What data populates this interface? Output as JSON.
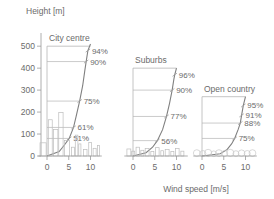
{
  "figure": {
    "y_axis_title": "Height [m]",
    "x_axis_title": "Wind speed [m/s]",
    "y_ticks": [
      "0",
      "100",
      "200",
      "300",
      "400",
      "500"
    ],
    "y_values": [
      0,
      100,
      200,
      300,
      400,
      500
    ],
    "x_ticks": [
      "0",
      "5",
      "10"
    ],
    "x_values": [
      0,
      5,
      10
    ]
  },
  "chart_data": {
    "type": "line",
    "title": "",
    "xlabel": "Wind speed [m/s]",
    "ylabel": "Height [m]",
    "xlim": [
      -2,
      13
    ],
    "ylim": [
      0,
      560
    ],
    "grid": false,
    "legend": "none",
    "panels": [
      {
        "name": "City centre",
        "title": "City centre",
        "roughness_class": "city-centre",
        "boundary_layer_height": 500,
        "profile_exponent": 0.36,
        "reference_wind_speed": 10,
        "annotations": [
          {
            "label": "94%",
            "height": 480,
            "wind_pct": 94
          },
          {
            "label": "90%",
            "height": 430,
            "wind_pct": 90
          },
          {
            "label": "75%",
            "height": 250,
            "wind_pct": 75
          },
          {
            "label": "61%",
            "height": 130,
            "wind_pct": 61
          },
          {
            "label": "51%",
            "height": 80,
            "wind_pct": 51
          }
        ],
        "profile_points": [
          {
            "h": 0,
            "u": 0.0
          },
          {
            "h": 20,
            "u": 0.28
          },
          {
            "h": 50,
            "u": 0.4
          },
          {
            "h": 80,
            "u": 0.51
          },
          {
            "h": 130,
            "u": 0.61
          },
          {
            "h": 180,
            "u": 0.67
          },
          {
            "h": 250,
            "u": 0.75
          },
          {
            "h": 320,
            "u": 0.82
          },
          {
            "h": 390,
            "u": 0.87
          },
          {
            "h": 430,
            "u": 0.9
          },
          {
            "h": 480,
            "u": 0.94
          },
          {
            "h": 510,
            "u": 1.0
          }
        ],
        "skyline": [
          {
            "x": -1.6,
            "w": 1.4,
            "h": 60
          },
          {
            "x": 0.3,
            "w": 0.9,
            "h": 165
          },
          {
            "x": 1.5,
            "w": 1.0,
            "h": 120
          },
          {
            "x": 2.7,
            "w": 1.0,
            "h": 198
          },
          {
            "x": 4.0,
            "w": 1.2,
            "h": 70
          },
          {
            "x": 5.6,
            "w": 0.7,
            "h": 40
          },
          {
            "x": 6.5,
            "w": 0.6,
            "h": 95
          },
          {
            "x": 7.3,
            "w": 0.5,
            "h": 55
          },
          {
            "x": 8.4,
            "w": 0.8,
            "h": 30
          },
          {
            "x": 9.6,
            "w": 0.6,
            "h": 62
          },
          {
            "x": 10.6,
            "w": 0.7,
            "h": 35
          },
          {
            "x": 11.6,
            "w": 0.5,
            "h": 48
          }
        ]
      },
      {
        "name": "Suburbs",
        "title": "Suburbs",
        "roughness_class": "suburbs",
        "boundary_layer_height": 400,
        "profile_exponent": 0.28,
        "reference_wind_speed": 10,
        "annotations": [
          {
            "label": "96%",
            "height": 370,
            "wind_pct": 96
          },
          {
            "label": "90%",
            "height": 300,
            "wind_pct": 90
          },
          {
            "label": "77%",
            "height": 180,
            "wind_pct": 77
          },
          {
            "label": "56%",
            "height": 70,
            "wind_pct": 56
          }
        ],
        "profile_points": [
          {
            "h": 0,
            "u": 0.0
          },
          {
            "h": 15,
            "u": 0.3
          },
          {
            "h": 40,
            "u": 0.45
          },
          {
            "h": 70,
            "u": 0.56
          },
          {
            "h": 120,
            "u": 0.68
          },
          {
            "h": 180,
            "u": 0.77
          },
          {
            "h": 240,
            "u": 0.84
          },
          {
            "h": 300,
            "u": 0.9
          },
          {
            "h": 350,
            "u": 0.94
          },
          {
            "h": 370,
            "u": 0.96
          },
          {
            "h": 400,
            "u": 1.0
          }
        ],
        "skyline": [
          {
            "x": -1.4,
            "w": 0.9,
            "h": 32
          },
          {
            "x": -0.3,
            "w": 0.7,
            "h": 22
          },
          {
            "x": 0.7,
            "w": 0.8,
            "h": 40
          },
          {
            "x": 1.8,
            "w": 0.7,
            "h": 26
          },
          {
            "x": 2.8,
            "w": 0.9,
            "h": 34
          },
          {
            "x": 4.1,
            "w": 0.7,
            "h": 20
          },
          {
            "x": 5.2,
            "w": 0.8,
            "h": 38
          },
          {
            "x": 6.4,
            "w": 0.6,
            "h": 24
          },
          {
            "x": 7.4,
            "w": 0.9,
            "h": 30
          },
          {
            "x": 8.7,
            "w": 0.7,
            "h": 20
          },
          {
            "x": 9.8,
            "w": 0.8,
            "h": 34
          },
          {
            "x": 11.0,
            "w": 0.7,
            "h": 22
          }
        ]
      },
      {
        "name": "Open country",
        "title": "Open country",
        "roughness_class": "open-country",
        "boundary_layer_height": 270,
        "profile_exponent": 0.16,
        "reference_wind_speed": 10,
        "annotations": [
          {
            "label": "95%",
            "height": 230,
            "wind_pct": 95
          },
          {
            "label": "91%",
            "height": 185,
            "wind_pct": 91
          },
          {
            "label": "88%",
            "height": 150,
            "wind_pct": 88
          },
          {
            "label": "75%",
            "height": 80,
            "wind_pct": 75
          }
        ],
        "profile_points": [
          {
            "h": 0,
            "u": 0.0
          },
          {
            "h": 10,
            "u": 0.42
          },
          {
            "h": 30,
            "u": 0.58
          },
          {
            "h": 55,
            "u": 0.68
          },
          {
            "h": 80,
            "u": 0.75
          },
          {
            "h": 120,
            "u": 0.83
          },
          {
            "h": 150,
            "u": 0.88
          },
          {
            "h": 185,
            "u": 0.91
          },
          {
            "h": 230,
            "u": 0.95
          },
          {
            "h": 270,
            "u": 1.0
          }
        ],
        "trees": [
          {
            "x": -1.2,
            "r": 3.4
          },
          {
            "x": 0.2,
            "r": 3.0
          },
          {
            "x": 1.4,
            "r": 3.6
          },
          {
            "x": 2.7,
            "r": 2.8
          },
          {
            "x": 3.9,
            "r": 3.4
          },
          {
            "x": 5.2,
            "r": 3.0
          },
          {
            "x": 6.5,
            "r": 3.6
          },
          {
            "x": 7.8,
            "r": 2.9
          },
          {
            "x": 9.1,
            "r": 3.3
          },
          {
            "x": 10.4,
            "r": 3.0
          },
          {
            "x": 11.6,
            "r": 3.4
          }
        ]
      }
    ]
  },
  "colors": {
    "axis": "#9a9a9a",
    "box": "#b5b5b5",
    "profile": "#808080",
    "text": "#6b6b6b",
    "background": "#ffffff"
  }
}
